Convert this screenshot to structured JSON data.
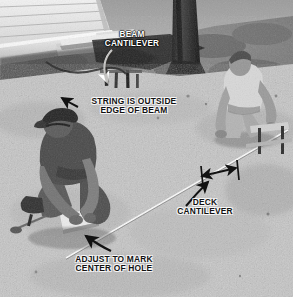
{
  "image": {
    "kind": "photograph",
    "color_mode": "black-and-white",
    "subject": "Two workers laying out deck footing holes with a string line in a dirt yard",
    "width": 303,
    "height": 307,
    "border_color": "#ffffff"
  },
  "scene": {
    "house_siding": "horizontal-lap-siding",
    "ledger_board": "light-wood-ledger-board",
    "tree_trunk": "dark-tree-trunk",
    "ground": "bare-dirt-yard",
    "string_line": "taut-layout-string",
    "batter_boards": "stakes-and-batter-boards",
    "worker_front": "crouching-worker-dark-shirt-cap",
    "worker_back": "kneeling-worker-light-tshirt"
  },
  "annotations": [
    {
      "id": "beam-cantilever",
      "text": "BEAM\nCANTILEVER",
      "style": "light",
      "color": "#ffffff",
      "leader": "curved-white-arrow-down"
    },
    {
      "id": "string-is-outside-edge-of-beam",
      "text": "STRING IS OUTSIDE\nEDGE OF BEAM",
      "style": "dark",
      "color": "#111111",
      "leader": "black-arrow-up-left"
    },
    {
      "id": "deck-cantilever",
      "text": "DECK\nCANTILEVER",
      "style": "dark",
      "color": "#111111",
      "leader": "black-double-headed-dimension-arrow"
    },
    {
      "id": "adjust-to-mark-center-of-hole",
      "text": "ADJUST TO MARK\nCENTER OF HOLE",
      "style": "dark",
      "color": "#111111",
      "leader": "black-curved-arrow-up-left"
    }
  ],
  "palette": {
    "sky_ground_light": "#d8d4cc",
    "dirt_mid": "#b2ada4",
    "dirt_dark": "#8d887f",
    "shadow": "#4a4741",
    "near_black": "#1c1a18",
    "siding_light": "#e2ded6",
    "board_light": "#eae6de",
    "white": "#ffffff"
  }
}
